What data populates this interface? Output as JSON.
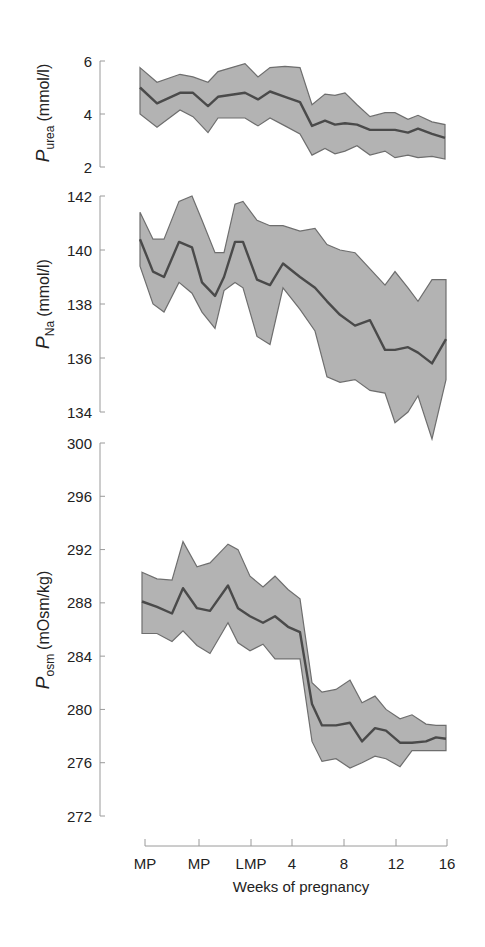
{
  "chart_data": [
    {
      "type": "area",
      "title": "",
      "ylabel": "P_urea (mmol/l)",
      "ylabel_main": "P",
      "ylabel_sub": "urea",
      "ylabel_unit": "(mmol/l)",
      "ylim": [
        2,
        6
      ],
      "yticks": [
        2,
        4,
        6
      ],
      "y_px": [
        167,
        61
      ],
      "x_px": [
        140,
        157,
        180,
        193,
        208,
        218,
        245,
        258,
        270,
        285,
        300,
        312,
        325,
        335,
        345,
        357,
        370,
        385,
        395,
        408,
        418,
        432,
        445
      ],
      "series": [
        {
          "name": "upper",
          "values": [
            5.75,
            5.2,
            5.5,
            5.4,
            5.2,
            5.6,
            5.9,
            5.4,
            5.75,
            5.8,
            5.75,
            4.35,
            4.75,
            4.7,
            4.8,
            4.35,
            3.9,
            4.05,
            4.05,
            3.8,
            3.95,
            3.7,
            3.6
          ]
        },
        {
          "name": "mean",
          "values": [
            5.0,
            4.4,
            4.8,
            4.8,
            4.3,
            4.65,
            4.8,
            4.55,
            4.85,
            4.65,
            4.45,
            3.55,
            3.75,
            3.6,
            3.65,
            3.6,
            3.4,
            3.4,
            3.4,
            3.3,
            3.45,
            3.25,
            3.1
          ]
        },
        {
          "name": "lower",
          "values": [
            4.0,
            3.5,
            4.15,
            3.9,
            3.3,
            3.85,
            3.85,
            3.55,
            3.85,
            3.55,
            3.25,
            2.45,
            2.7,
            2.5,
            2.6,
            2.8,
            2.45,
            2.6,
            2.35,
            2.45,
            2.35,
            2.4,
            2.3
          ]
        }
      ]
    },
    {
      "type": "area",
      "title": "",
      "ylabel": "P_Na (mmol/l)",
      "ylabel_main": "P",
      "ylabel_sub": "Na",
      "ylabel_unit": "(mmol/l)",
      "ylim": [
        134,
        142
      ],
      "yticks": [
        134,
        136,
        138,
        140,
        142
      ],
      "y_px": [
        412,
        196
      ],
      "x_px": [
        140,
        153,
        164,
        179,
        192,
        202,
        215,
        224,
        235,
        243,
        257,
        270,
        283,
        300,
        315,
        327,
        340,
        355,
        370,
        385,
        395,
        408,
        418,
        432,
        446
      ],
      "series": [
        {
          "name": "upper",
          "values": [
            141.4,
            140.4,
            140.4,
            141.8,
            142.0,
            141.1,
            139.9,
            139.9,
            141.7,
            141.8,
            141.1,
            140.9,
            140.9,
            140.7,
            140.8,
            140.2,
            140.0,
            139.9,
            139.3,
            138.7,
            139.2,
            138.6,
            138.1,
            138.9,
            138.9
          ]
        },
        {
          "name": "mean",
          "values": [
            140.4,
            139.2,
            139.0,
            140.3,
            140.1,
            138.8,
            138.3,
            139.0,
            140.3,
            140.3,
            138.9,
            138.7,
            139.5,
            139.0,
            138.6,
            138.1,
            137.6,
            137.2,
            137.4,
            136.3,
            136.3,
            136.4,
            136.2,
            135.8,
            136.7
          ]
        },
        {
          "name": "lower",
          "values": [
            139.4,
            138.0,
            137.7,
            138.8,
            138.4,
            137.7,
            137.1,
            138.5,
            138.8,
            138.6,
            136.8,
            136.5,
            138.6,
            137.8,
            137.0,
            135.3,
            135.1,
            135.2,
            134.8,
            134.7,
            133.6,
            134.0,
            134.6,
            133.0,
            135.2
          ]
        }
      ]
    },
    {
      "type": "area",
      "title": "",
      "ylabel": "P_osm (mOsm/kg)",
      "ylabel_main": "P",
      "ylabel_sub": "osm",
      "ylabel_unit": "(mOsm/kg)",
      "ylim": [
        272,
        300
      ],
      "yticks": [
        272,
        276,
        280,
        284,
        288,
        292,
        296,
        300
      ],
      "y_px": [
        816,
        443
      ],
      "x_px": [
        142,
        157,
        172,
        183,
        197,
        210,
        228,
        238,
        250,
        263,
        275,
        288,
        300,
        312,
        322,
        336,
        350,
        362,
        375,
        386,
        400,
        412,
        426,
        436,
        446
      ],
      "series": [
        {
          "name": "upper",
          "values": [
            290.3,
            289.8,
            289.7,
            292.6,
            290.7,
            291.0,
            292.4,
            292.0,
            290.0,
            289.2,
            290.0,
            289.0,
            288.3,
            282.0,
            281.3,
            281.5,
            282.2,
            280.5,
            281.0,
            280.0,
            279.3,
            279.6,
            278.9,
            278.8,
            278.8
          ]
        },
        {
          "name": "mean",
          "values": [
            288.1,
            287.7,
            287.2,
            289.1,
            287.6,
            287.4,
            289.3,
            287.6,
            287.0,
            286.5,
            287.0,
            286.2,
            285.8,
            280.4,
            278.8,
            278.8,
            279.0,
            277.6,
            278.6,
            278.4,
            277.5,
            277.5,
            277.6,
            277.9,
            277.8
          ]
        },
        {
          "name": "lower",
          "values": [
            285.7,
            285.7,
            285.1,
            285.9,
            284.8,
            284.2,
            286.5,
            285.0,
            284.4,
            284.9,
            283.8,
            283.8,
            283.8,
            277.6,
            276.1,
            276.3,
            275.6,
            276.0,
            276.5,
            276.3,
            275.7,
            276.9,
            276.9,
            276.9,
            276.9
          ]
        }
      ]
    }
  ],
  "x_axis": {
    "label": "Weeks of pregnancy",
    "ticks": [
      {
        "label": "MP",
        "x": 145
      },
      {
        "label": "MP",
        "x": 199
      },
      {
        "label": "LMP",
        "x": 251
      },
      {
        "label": "4",
        "x": 292
      },
      {
        "label": "8",
        "x": 344
      },
      {
        "label": "12",
        "x": 396
      },
      {
        "label": "16",
        "x": 447
      }
    ]
  },
  "colors": {
    "band_fill": "#b3b3b3",
    "band_edge": "#6e6e6e",
    "mean_line": "#4a4a4a",
    "axis": "#9a9a9a"
  }
}
